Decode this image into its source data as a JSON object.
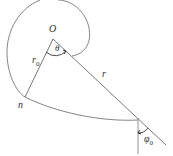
{
  "diagram": {
    "type": "spiral-geometry",
    "labels": {
      "origin": "O",
      "angle_theta": "θ",
      "radius_initial": "r",
      "radius_initial_sub": "0",
      "radius": "r",
      "point": "n",
      "angle_phi": "φ",
      "angle_phi_sub": "0"
    },
    "colors": {
      "stroke": "#555555",
      "text": "#333333"
    }
  }
}
